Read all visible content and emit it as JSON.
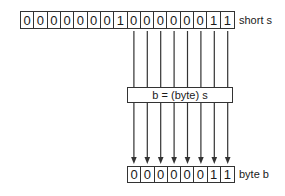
{
  "diagram": {
    "source": {
      "label": "short s",
      "bits": [
        "0",
        "0",
        "0",
        "0",
        "0",
        "0",
        "0",
        "1",
        "0",
        "0",
        "0",
        "0",
        "0",
        "0",
        "1",
        "1"
      ]
    },
    "operation": {
      "label": "b = (byte) s"
    },
    "target": {
      "label": "byte b",
      "bits": [
        "0",
        "0",
        "0",
        "0",
        "0",
        "0",
        "1",
        "1"
      ]
    },
    "connections": {
      "from_source_bit_indices": [
        8,
        9,
        10,
        11,
        12,
        13,
        14,
        15
      ],
      "to_target_bit_indices": [
        0,
        1,
        2,
        3,
        4,
        5,
        6,
        7
      ],
      "arrowheads_on": "target"
    },
    "colors": {
      "line": "#333333",
      "text": "#1a1a1a",
      "background": "#ffffff"
    }
  }
}
